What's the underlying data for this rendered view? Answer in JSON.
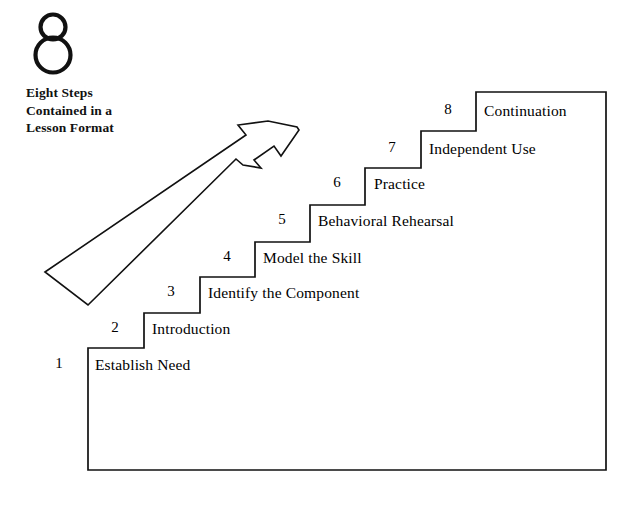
{
  "page": {
    "background_color": "#ffffff",
    "line_color": "#111111"
  },
  "logo": {
    "icon_name": "figure-eight-logo",
    "digit": "8",
    "caption": "Eight Steps\nContained in a\nLesson Format"
  },
  "arrow": {
    "icon_name": "upward-progress-arrow",
    "description": "outlined diagonal arrow pointing up and to the right",
    "fill": "#ffffff",
    "stroke": "#111111"
  },
  "chart_data": {
    "type": "diagram",
    "title": "Eight Steps Contained in a Lesson Format",
    "layout": "ascending staircase, left to right",
    "steps": [
      {
        "number": "1",
        "label": "Establish Need"
      },
      {
        "number": "2",
        "label": "Introduction"
      },
      {
        "number": "3",
        "label": "Identify the Component"
      },
      {
        "number": "4",
        "label": "Model the Skill"
      },
      {
        "number": "5",
        "label": "Behavioral Rehearsal"
      },
      {
        "number": "6",
        "label": "Practice"
      },
      {
        "number": "7",
        "label": "Independent Use"
      },
      {
        "number": "8",
        "label": "Continuation"
      }
    ]
  },
  "steps": [
    {
      "number": "1",
      "label": "Establish Need",
      "num_x": 48,
      "num_y": 355,
      "label_x": 95,
      "label_y": 356
    },
    {
      "number": "2",
      "label": "Introduction",
      "num_x": 104,
      "num_y": 319,
      "label_x": 152,
      "label_y": 320
    },
    {
      "number": "3",
      "label": "Identify the Component",
      "num_x": 160,
      "num_y": 283,
      "label_x": 208,
      "label_y": 284
    },
    {
      "number": "4",
      "label": "Model the Skill",
      "num_x": 216,
      "num_y": 248,
      "label_x": 263,
      "label_y": 249
    },
    {
      "number": "5",
      "label": "Behavioral Rehearsal",
      "num_x": 271,
      "num_y": 211,
      "label_x": 318,
      "label_y": 212
    },
    {
      "number": "6",
      "label": "Practice",
      "num_x": 326,
      "num_y": 174,
      "label_x": 374,
      "label_y": 175
    },
    {
      "number": "7",
      "label": "Independent Use",
      "num_x": 381,
      "num_y": 139,
      "label_x": 429,
      "label_y": 140
    },
    {
      "number": "8",
      "label": "Continuation",
      "num_x": 437,
      "num_y": 101,
      "label_x": 484,
      "label_y": 102
    }
  ]
}
